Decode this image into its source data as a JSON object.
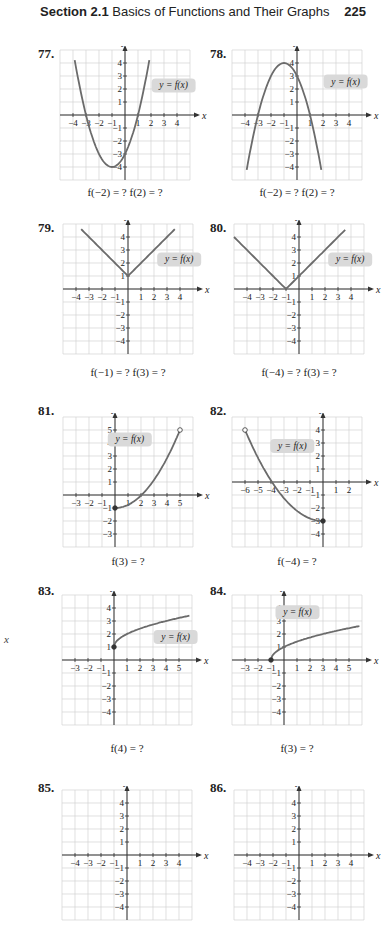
{
  "header": {
    "section_label": "Section 2.1",
    "section_title": "Basics of Functions and Their Graphs",
    "page_number": "225"
  },
  "margin": {
    "stray_x_label": "x"
  },
  "colors": {
    "curve": "#6b6b6b",
    "grid": "#d2d2d2",
    "axis": "#333333",
    "label_bubble": "#d9d9d9"
  },
  "problems": [
    {
      "number": "77.",
      "caption": "f(−2) = ?  f(2) = ?",
      "curve_label": "y = f(x)",
      "x_range": [
        -4,
        4
      ],
      "y_range": [
        -4,
        4
      ],
      "curve": "parabola up: vertex (-1,-4), zeros -3 and 1, y-int -3, arrows both ends"
    },
    {
      "number": "78.",
      "caption": "f(−2) = ?  f(2) = ?",
      "curve_label": "y = f(x)",
      "x_range": [
        -4,
        4
      ],
      "y_range": [
        -4,
        4
      ],
      "curve": "parabola down: vertex (-1,4), zeros -3 and 1, y-int 3, arrows both ends"
    },
    {
      "number": "79.",
      "caption": "f(−1) = ?  f(3) = ?",
      "curve_label": "y = f(x)",
      "x_range": [
        -4,
        4
      ],
      "y_range": [
        -4,
        4
      ],
      "curve": "V shape: vertex (0,1), slope ±1, arrows both ends"
    },
    {
      "number": "80.",
      "caption": "f(−4) = ?  f(3) = ?",
      "curve_label": "y = f(x)",
      "x_range": [
        -4,
        4
      ],
      "y_range": [
        -4,
        4
      ],
      "curve": "V shape: vertex (-1,0), slope ±1, arrows both ends"
    },
    {
      "number": "81.",
      "caption": "f(3) = ?",
      "curve_label": "y = f(x)",
      "x_range": [
        -3,
        5
      ],
      "y_range": [
        -3,
        5
      ],
      "curve": "closed dot (0,-1) rising to open dot (5,5), through (2,0)"
    },
    {
      "number": "82.",
      "caption": "f(−4) = ?",
      "curve_label": "y = f(x)",
      "x_range": [
        -6,
        2
      ],
      "y_range": [
        -4,
        4
      ],
      "curve": "open dot (-6,4) falling to closed dot (0,-3), through (-4,0)"
    },
    {
      "number": "83.",
      "caption": "f(4) = ?",
      "curve_label": "y = f(x)",
      "x_range": [
        -3,
        5
      ],
      "y_range": [
        -4,
        4
      ],
      "curve": "closed dot (0,1), square-root shape rising, arrow right"
    },
    {
      "number": "84.",
      "caption": "f(3) = ?",
      "curve_label": "y = f(x)",
      "x_range": [
        -3,
        5
      ],
      "y_range": [
        -4,
        4
      ],
      "curve": "closed dot (-1,0), square-root shape through (0,1), arrow right"
    },
    {
      "number": "85.",
      "caption": "",
      "curve_label": "",
      "x_range": [
        -4,
        4
      ],
      "y_range": [
        -4,
        4
      ],
      "curve": "partially visible"
    },
    {
      "number": "86.",
      "caption": "",
      "curve_label": "",
      "x_range": [
        -4,
        4
      ],
      "y_range": [
        -4,
        4
      ],
      "curve": "partially visible"
    }
  ],
  "axis_labels": {
    "x": "x",
    "y": "y"
  }
}
